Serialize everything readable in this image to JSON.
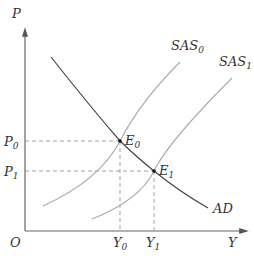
{
  "diagram": {
    "axes": {
      "y_label": "P",
      "x_label": "Y",
      "origin_label": "O"
    },
    "curves": [
      {
        "id": "AD",
        "label": "AD",
        "label_main": "AD",
        "label_sub": ""
      },
      {
        "id": "SAS0",
        "label": "SAS0",
        "label_main": "SAS",
        "label_sub": "0"
      },
      {
        "id": "SAS1",
        "label": "SAS1",
        "label_main": "SAS",
        "label_sub": "1"
      }
    ],
    "equilibria": [
      {
        "id": "E0",
        "label_main": "E",
        "label_sub": "0",
        "price_main": "P",
        "price_sub": "0",
        "output_main": "Y",
        "output_sub": "0"
      },
      {
        "id": "E1",
        "label_main": "E",
        "label_sub": "1",
        "price_main": "P",
        "price_sub": "1",
        "output_main": "Y",
        "output_sub": "1"
      }
    ],
    "colors": {
      "axis": "#555555",
      "ad_curve": "#444444",
      "sas_curves": "#aaaaaa",
      "dashed": "#999999",
      "point": "#111111",
      "text": "#333333"
    }
  }
}
